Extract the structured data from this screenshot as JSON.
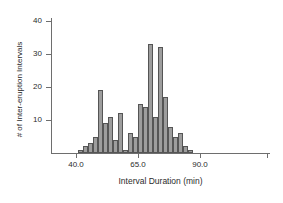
{
  "chart_data": {
    "type": "bar",
    "title": "",
    "subtitle": "",
    "xlabel": "Interval Duration (min)",
    "ylabel": "# of Inter-eruption Intervals",
    "grid": false,
    "legend": false,
    "xlim": [
      38,
      97
    ],
    "ylim": [
      0,
      42
    ],
    "bin_width": 2,
    "x_ticks": [
      40.0,
      65.0,
      90.0
    ],
    "x_tick_labels": [
      "40.0",
      "65.0",
      "90.0"
    ],
    "y_ticks": [
      10,
      20,
      30,
      40
    ],
    "y_tick_labels": [
      "10",
      "20",
      "30",
      "40"
    ],
    "bin_starts": [
      41,
      43,
      45,
      47,
      49,
      51,
      53,
      55,
      57,
      59,
      61,
      63,
      65,
      67,
      69,
      71,
      73,
      75,
      77,
      79,
      81,
      83,
      85,
      87,
      89,
      91,
      93,
      95
    ],
    "categories": [
      "41",
      "43",
      "45",
      "47",
      "49",
      "51",
      "53",
      "55",
      "57",
      "59",
      "61",
      "63",
      "65",
      "67",
      "69",
      "71",
      "73",
      "75",
      "77",
      "79",
      "81",
      "83",
      "85",
      "87",
      "89",
      "91",
      "93",
      "95"
    ],
    "values": [
      1,
      2,
      3,
      5,
      19,
      9,
      11,
      4,
      12,
      1,
      6,
      5,
      15,
      14,
      33,
      11,
      32,
      17,
      8,
      5,
      6,
      2,
      1,
      0,
      0,
      0,
      0,
      0
    ],
    "bar_color": "#9d9d9d",
    "bar_edge_color": "#555555",
    "axis_color": "#6e6e6e",
    "text_color": "#2b2b2b",
    "background_color": "#ffffff"
  }
}
